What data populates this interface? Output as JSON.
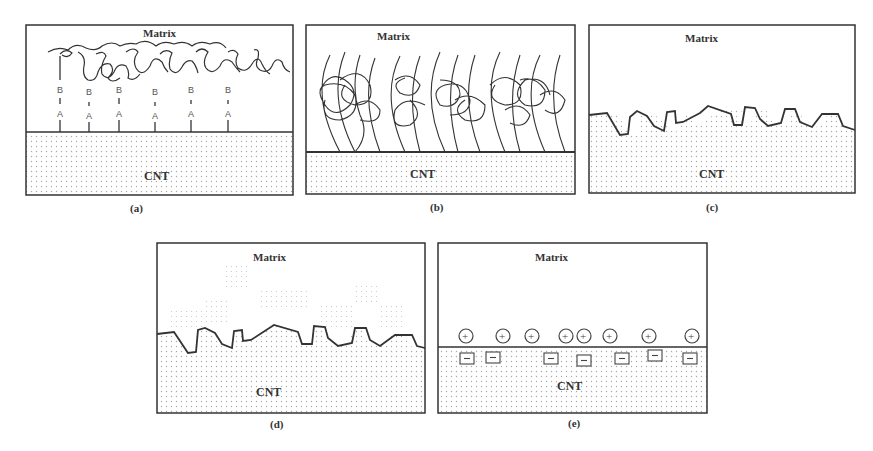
{
  "figure": {
    "panels": [
      {
        "id": "a",
        "caption": "(a)",
        "top_label": "Matrix",
        "bottom_label": "CNT",
        "mechanism": "polymer chain entanglement via A-B linker molecules",
        "linker_labels": {
          "upper": "B",
          "lower": "A"
        },
        "linker_count": 6
      },
      {
        "id": "b",
        "caption": "(b)",
        "top_label": "Matrix",
        "bottom_label": "CNT",
        "mechanism": "polymer chain wrapping / entanglement at interface"
      },
      {
        "id": "c",
        "caption": "(c)",
        "top_label": "Matrix",
        "bottom_label": "CNT",
        "mechanism": "mechanical interlocking at rough interface"
      },
      {
        "id": "d",
        "caption": "(d)",
        "top_label": "Matrix",
        "bottom_label": "CNT",
        "mechanism": "mechanical interlocking with interdiffusion"
      },
      {
        "id": "e",
        "caption": "(e)",
        "top_label": "Matrix",
        "bottom_label": "CNT",
        "mechanism": "electrostatic attraction",
        "positive_symbol": "+",
        "negative_symbol": "−",
        "positive_count": 8,
        "negative_count": 8
      }
    ],
    "colors": {
      "line": "#333333",
      "dots": "#9a9a9a",
      "background": "#ffffff"
    }
  }
}
